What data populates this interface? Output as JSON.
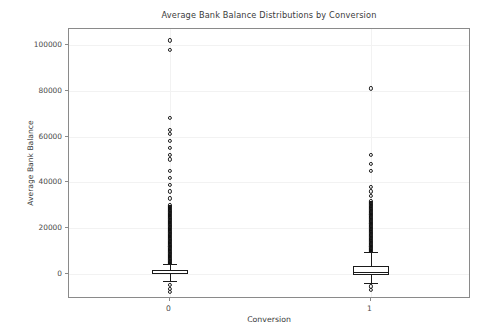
{
  "chart_data": {
    "type": "box",
    "title": "Average Bank Balance Distributions by Conversion",
    "xlabel": "Conversion",
    "ylabel": "Average Bank Balance",
    "grid": true,
    "legend": false,
    "xtick_labels": [
      "0",
      "1"
    ],
    "ytick_labels": [
      "0",
      "20000",
      "40000",
      "60000",
      "80000",
      "100000"
    ],
    "ytick_values": [
      0,
      20000,
      40000,
      60000,
      80000,
      100000
    ],
    "ylim": [
      -11000,
      107000
    ],
    "categories": [
      "0",
      "1"
    ],
    "series": [
      {
        "name": "0",
        "x_position": 0,
        "whisker_low": -3200,
        "q1": -100,
        "median": 450,
        "q3": 1700,
        "whisker_high": 4500,
        "fliers_notable": [
          102000,
          98000,
          68000,
          63000,
          61000,
          58000,
          55000,
          52000,
          50000,
          45000,
          42000,
          39000,
          36000,
          33000,
          30000,
          27000,
          24000,
          21000,
          18000,
          15000,
          12000,
          9000,
          6000,
          -5000,
          -6500,
          -8000
        ],
        "flier_count_label": "dense",
        "dense_band_top": 30000,
        "dense_band_bottom": 4500
      },
      {
        "name": "1",
        "x_position": 1,
        "whisker_low": -3800,
        "q1": -400,
        "median": 900,
        "q3": 3400,
        "whisker_high": 9500,
        "fliers_notable": [
          81000,
          52000,
          48000,
          45000,
          38000,
          36000,
          34000,
          32000,
          30000,
          28000,
          26000,
          24000,
          22000,
          20000,
          18000,
          16000,
          14000,
          12000,
          -5500,
          -7000
        ],
        "flier_count_label": "dense",
        "dense_band_top": 32000,
        "dense_band_bottom": 9500
      }
    ],
    "colors": {
      "box_edge": "#1a1a1a",
      "median": "#1a1a1a",
      "flier_edge": "#1f1f1f",
      "grid": "#f2f2f2",
      "frame": "#8a8a8a",
      "text": "#3b3b3b",
      "background": "#ffffff"
    }
  }
}
